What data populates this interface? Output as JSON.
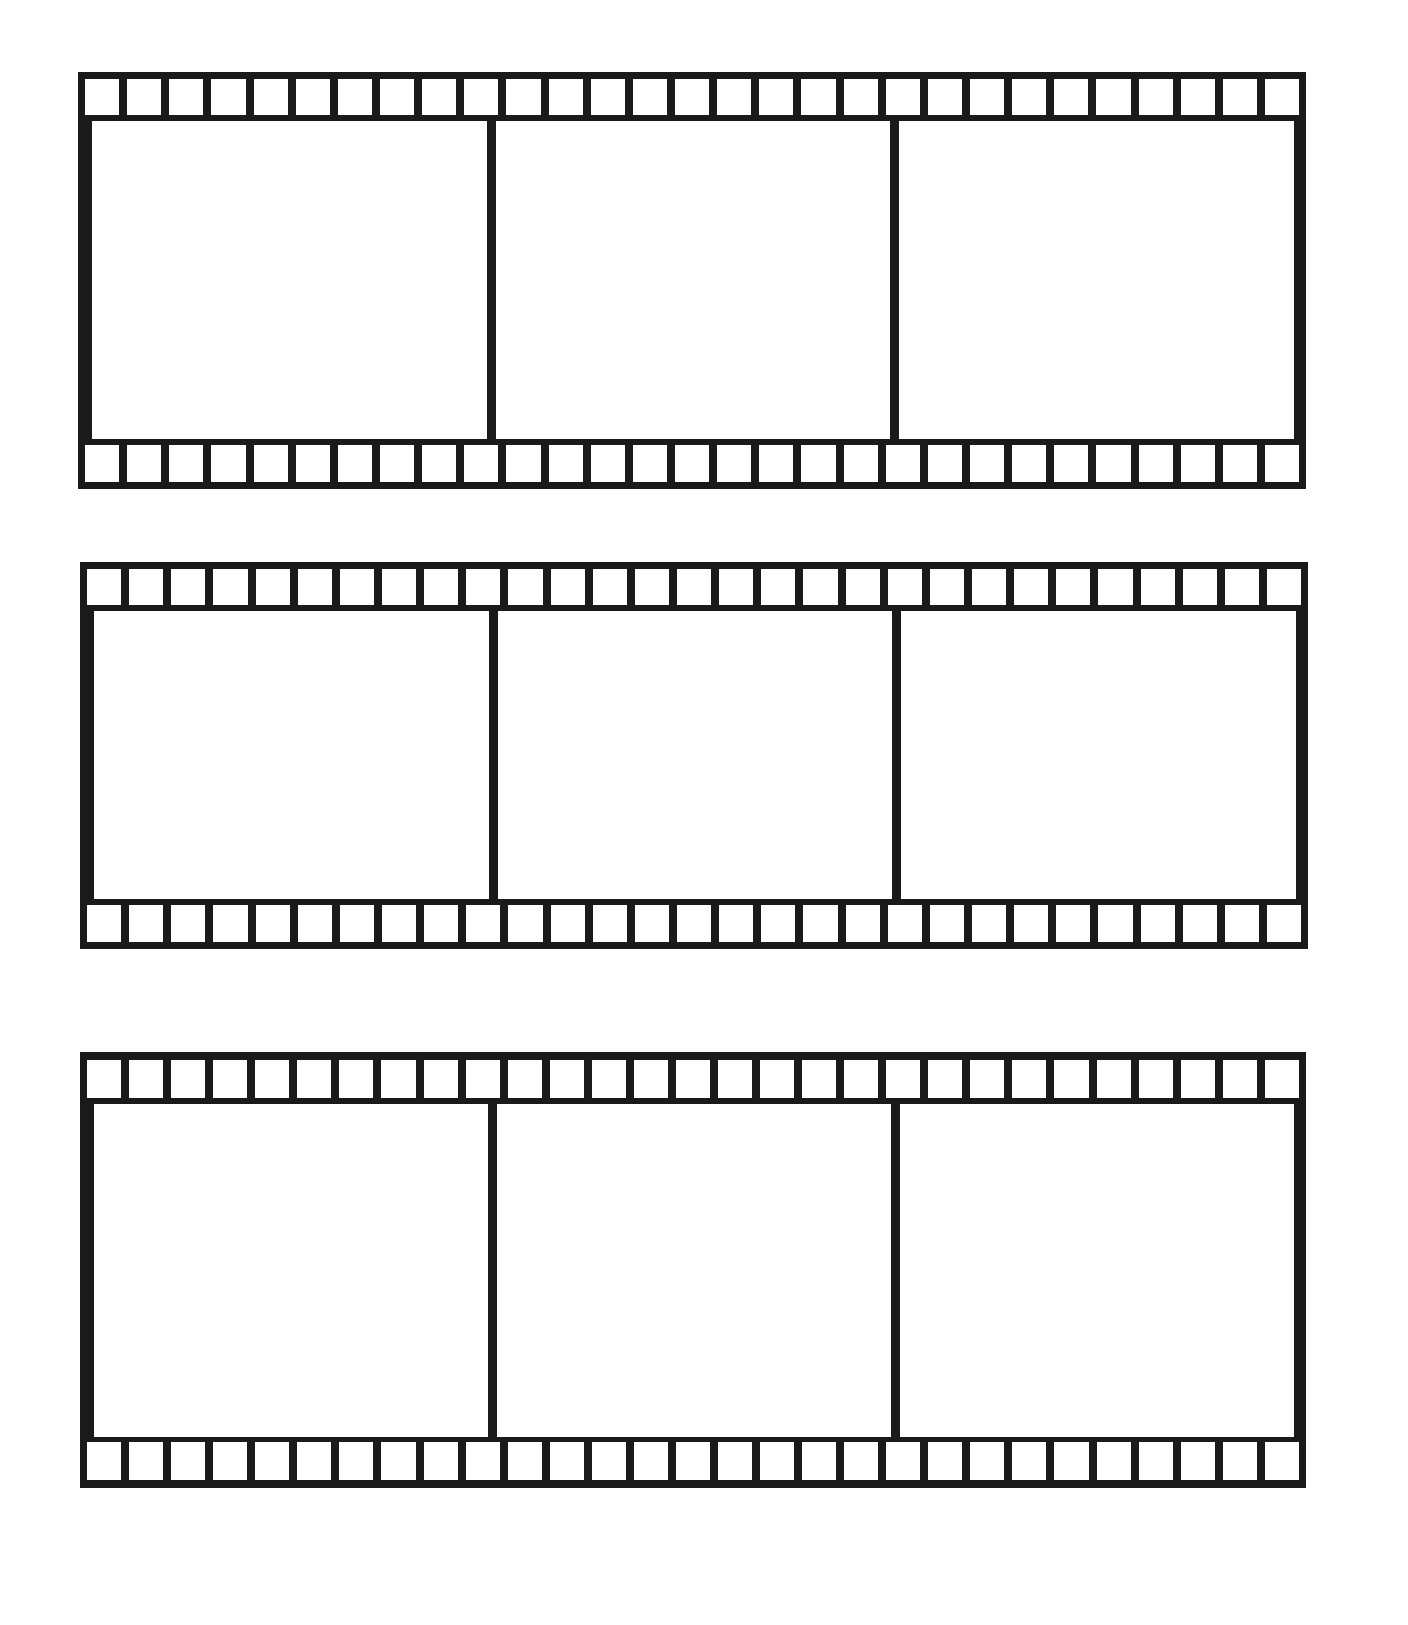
{
  "page": {
    "type": "printable worksheet"
  },
  "strips": [
    {
      "name": "film-strip-1",
      "frames": [
        {
          "index": 1,
          "content": ""
        },
        {
          "index": 2,
          "content": ""
        },
        {
          "index": 3,
          "content": ""
        }
      ],
      "sprocket_holes_per_row": 29
    },
    {
      "name": "film-strip-2",
      "frames": [
        {
          "index": 1,
          "content": ""
        },
        {
          "index": 2,
          "content": ""
        },
        {
          "index": 3,
          "content": ""
        }
      ],
      "sprocket_holes_per_row": 29
    },
    {
      "name": "film-strip-3",
      "frames": [
        {
          "index": 1,
          "content": ""
        },
        {
          "index": 2,
          "content": ""
        },
        {
          "index": 3,
          "content": ""
        }
      ],
      "sprocket_holes_per_row": 29
    }
  ],
  "colors": {
    "film": "#1a1a1a",
    "paper": "#ffffff"
  }
}
